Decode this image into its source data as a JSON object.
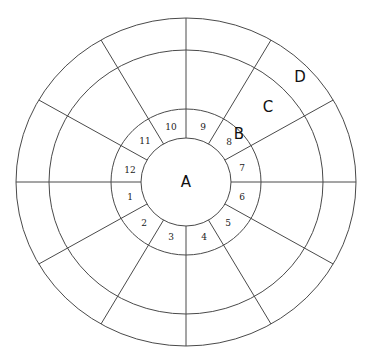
{
  "diagram": {
    "zones": {
      "center": "A",
      "ring_b": "B",
      "ring_c": "C",
      "ring_d": "D"
    },
    "segments": [
      "1",
      "2",
      "3",
      "4",
      "5",
      "6",
      "7",
      "8",
      "9",
      "10",
      "11",
      "12"
    ],
    "colors": {
      "line": "#4a4a4a",
      "background": "#ffffff"
    }
  }
}
